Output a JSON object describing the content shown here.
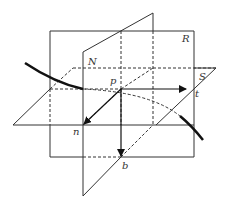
{
  "diagram": {
    "planes": [
      {
        "name": "R",
        "label": "R"
      },
      {
        "name": "S",
        "label": "S"
      },
      {
        "name": "N",
        "label": "N"
      }
    ],
    "point": {
      "label": "p"
    },
    "vectors": [
      {
        "label": "t",
        "direction": "tangent"
      },
      {
        "label": "n",
        "direction": "normal"
      },
      {
        "label": "b",
        "direction": "binormal"
      }
    ],
    "colors": {
      "line": "#333333",
      "curve": "#111111",
      "background": "#ffffff"
    }
  }
}
